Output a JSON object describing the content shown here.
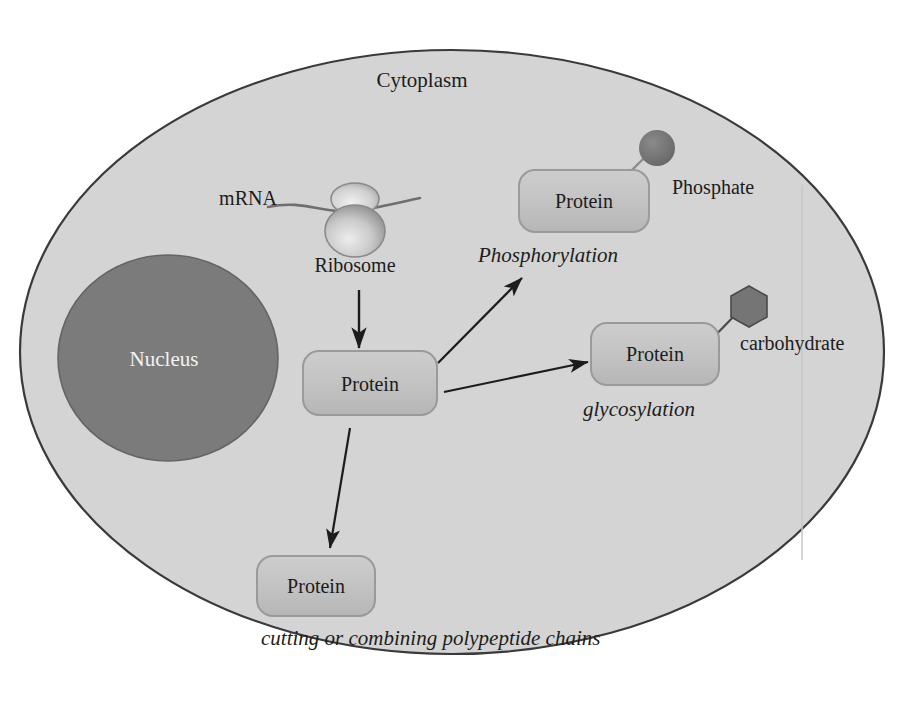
{
  "diagram": {
    "cell": {
      "cytoplasm_label": "Cytoplasm",
      "nucleus_label": "Nucleus"
    },
    "translation": {
      "mrna_label": "mRNA",
      "ribosome_label": "Ribosome"
    },
    "proteins": {
      "central_label": "Protein",
      "phosphorylated_label": "Protein",
      "glycosylated_label": "Protein",
      "cleaved_label": "Protein"
    },
    "modifications": [
      {
        "name": "phosphorylation",
        "process_label": "Phosphorylation",
        "group_label": "Phosphate",
        "group_shape": "circle"
      },
      {
        "name": "glycosylation",
        "process_label": "glycosylation",
        "group_label": "carbohydrate",
        "group_shape": "hexagon"
      },
      {
        "name": "proteolysis",
        "process_label": "cutting or combining polypeptide chains",
        "group_label": "",
        "group_shape": "none"
      }
    ],
    "colors": {
      "page_background": "#ffffff",
      "cytoplasm_fill": "#d4d4d4",
      "cell_outline": "#3a3a3a",
      "nucleus_fill": "#7b7b7b",
      "nucleus_outline": "#5e5e5e",
      "protein_box_fill": "#c3c3c3",
      "protein_box_outline": "#8d8d8d",
      "phosphate_fill": "#717171",
      "carbohydrate_fill": "#757575",
      "arrow_stroke": "#1c1c1c",
      "mrna_stroke": "#6f6f6f",
      "ribosome_fill": "#b5b5b5",
      "text_dark": "#1c1c1c",
      "text_light": "#f2f2f2",
      "scan_line": "#c8c8c8"
    }
  }
}
